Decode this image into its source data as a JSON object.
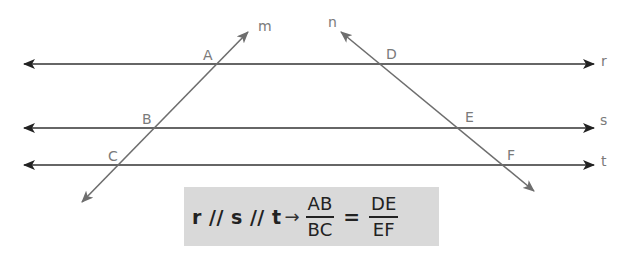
{
  "diagram": {
    "colors": {
      "parallel_lines": "#222222",
      "transversals": "#6e6e6e",
      "labels": "#7a7a7a",
      "formula_bg": "#d9d9d9",
      "formula_text": "#222222"
    },
    "parallel_lines": [
      {
        "name": "r",
        "y": 64
      },
      {
        "name": "s",
        "y": 128
      },
      {
        "name": "t",
        "y": 165
      }
    ],
    "transversals": [
      {
        "name": "m",
        "from": [
          82,
          202
        ],
        "to": [
          248,
          32
        ]
      },
      {
        "name": "n",
        "from": [
          341,
          32
        ],
        "to": [
          534,
          191
        ]
      }
    ],
    "points": [
      {
        "name": "A",
        "on": [
          "m",
          "r"
        ]
      },
      {
        "name": "B",
        "on": [
          "m",
          "s"
        ]
      },
      {
        "name": "C",
        "on": [
          "m",
          "t"
        ]
      },
      {
        "name": "D",
        "on": [
          "n",
          "r"
        ]
      },
      {
        "name": "E",
        "on": [
          "n",
          "s"
        ]
      },
      {
        "name": "F",
        "on": [
          "n",
          "t"
        ]
      }
    ],
    "labels": {
      "m": "m",
      "n": "n",
      "r": "r",
      "s": "s",
      "t": "t",
      "A": "A",
      "B": "B",
      "C": "C",
      "D": "D",
      "E": "E",
      "F": "F"
    }
  },
  "formula": {
    "premise": "r // s // t",
    "arrow": "→",
    "left_fraction": {
      "numerator": "AB",
      "denominator": "BC"
    },
    "equals": "=",
    "right_fraction": {
      "numerator": "DE",
      "denominator": "EF"
    }
  }
}
